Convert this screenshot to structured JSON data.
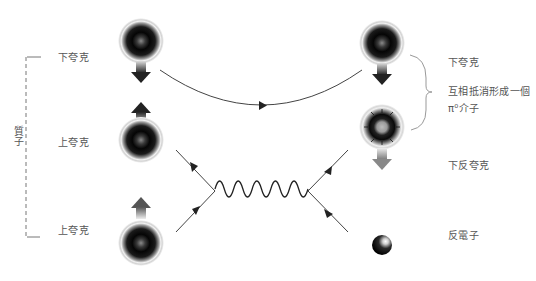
{
  "diagram": {
    "type": "feynman-particle-decay",
    "left_group": {
      "bracket_label": "質子",
      "particles": [
        {
          "label": "下夸克",
          "kind": "quark",
          "spin": "down"
        },
        {
          "label": "上夸克",
          "kind": "quark",
          "spin": "up"
        },
        {
          "label": "上夸克",
          "kind": "quark",
          "spin": "up"
        }
      ]
    },
    "right_group": {
      "particles": [
        {
          "label": "下夸克",
          "kind": "quark",
          "spin": "down"
        },
        {
          "label": "下反夸克",
          "kind": "antiquark",
          "spin": "down"
        },
        {
          "label": "反電子",
          "kind": "positron"
        }
      ],
      "brace_annotation": {
        "line1": "互相抵消形成一個",
        "line2": "π⁰介子"
      }
    },
    "propagators": [
      {
        "name": "quark-line",
        "from": "下夸克 (left)",
        "to": "下夸克 (right)",
        "style": "solid-arc-with-arrow"
      },
      {
        "name": "boson",
        "style": "wavy"
      }
    ],
    "colors": {
      "line": "#444444",
      "label_text": "#555555",
      "particle_core": "#000000",
      "bracket": "#888888"
    }
  }
}
